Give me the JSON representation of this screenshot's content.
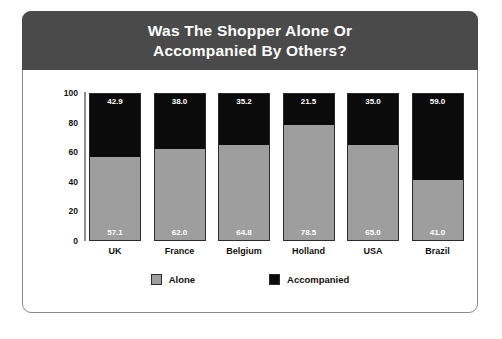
{
  "header": {
    "title": "Was The Shopper Alone Or\nAccompanied By Others?",
    "band_color": "#4a4a4a",
    "title_color": "#ffffff"
  },
  "legend": {
    "position": "bottom-center",
    "items": [
      {
        "label": "Alone",
        "color": "#9e9e9e"
      },
      {
        "label": "Accompanied",
        "color": "#0b0b0b"
      }
    ]
  },
  "axis": {
    "y_ticks": [
      "100",
      "80",
      "60",
      "40",
      "20",
      "0"
    ]
  },
  "chart_data": {
    "type": "bar",
    "subtype": "stacked-100-percent",
    "title": "Was The Shopper Alone Or Accompanied By Others?",
    "xlabel": "",
    "ylabel": "",
    "ylim": [
      0,
      100
    ],
    "yticks": [
      0,
      20,
      40,
      60,
      80,
      100
    ],
    "grid": false,
    "legend_position": "bottom-center",
    "categories": [
      "UK",
      "France",
      "Belgium",
      "Holland",
      "USA",
      "Brazil"
    ],
    "series": [
      {
        "name": "Alone",
        "color": "#9e9e9e",
        "values": [
          57.1,
          62.0,
          64.8,
          78.5,
          65.0,
          41.0
        ],
        "labels": [
          "57.1",
          "62.0",
          "64.8",
          "78.5",
          "65.0",
          "41.0"
        ]
      },
      {
        "name": "Accompanied",
        "color": "#0b0b0b",
        "values": [
          42.9,
          38.0,
          35.2,
          21.5,
          35.0,
          59.0
        ],
        "labels": [
          "42.9",
          "38.0",
          "35.2",
          "21.5",
          "35.0",
          "59.0"
        ]
      }
    ]
  }
}
